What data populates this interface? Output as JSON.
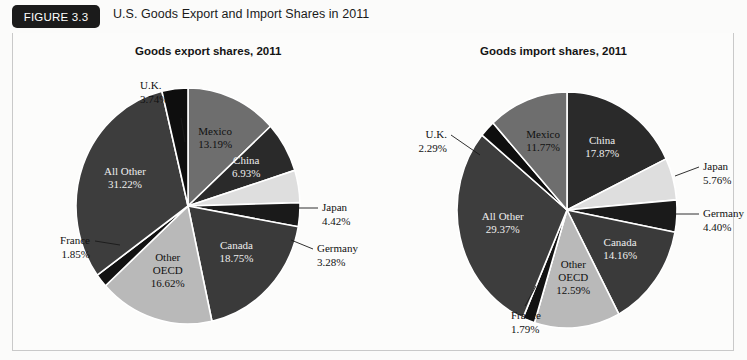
{
  "header": {
    "badge": "FIGURE 3.3",
    "title": "U.S. Goods Export and Import Shares in 2011"
  },
  "palette": {
    "black": "#111111",
    "dark_gray": "#3a3a3a",
    "mid_gray": "#6e6e6e",
    "light_gray": "#b9b9b9",
    "pale": "#dedede",
    "separator": "#ffffff",
    "text": "#111111",
    "text_on_dark": "#ededed",
    "badge_bg": "#1b1b1b",
    "frame_border": "#c9c9c9",
    "page_bg": "#fbfbfa"
  },
  "chart_data": [
    {
      "type": "pie",
      "id": "export",
      "title": "Goods export shares, 2011",
      "unit": "%",
      "start_angle": 0,
      "categories": [
        "Mexico",
        "China",
        "Japan",
        "Germany",
        "Canada",
        "Other OECD",
        "France",
        "All Other",
        "U.K."
      ],
      "values": [
        13.19,
        6.93,
        4.42,
        3.28,
        18.75,
        16.62,
        1.85,
        31.22,
        3.74
      ],
      "slices": [
        {
          "label": "Mexico",
          "value": 13.19,
          "text": "13.19%",
          "color": "#6e6e6e",
          "label_pos": "inside",
          "on_dark": false
        },
        {
          "label": "China",
          "value": 6.93,
          "text": "6.93%",
          "color": "#2a2a2a",
          "label_pos": "inside",
          "on_dark": true
        },
        {
          "label": "Japan",
          "value": 4.42,
          "text": "4.42%",
          "color": "#dedede",
          "label_pos": "outside",
          "on_dark": false
        },
        {
          "label": "Germany",
          "value": 3.28,
          "text": "3.28%",
          "color": "#1a1a1a",
          "label_pos": "outside",
          "on_dark": false
        },
        {
          "label": "Canada",
          "value": 18.75,
          "text": "18.75%",
          "color": "#3a3a3a",
          "label_pos": "inside",
          "on_dark": true
        },
        {
          "label": "Other OECD",
          "value": 16.62,
          "text": "16.62%",
          "color": "#b9b9b9",
          "label_pos": "inside",
          "on_dark": false
        },
        {
          "label": "France",
          "value": 1.85,
          "text": "1.85%",
          "color": "#121212",
          "label_pos": "outside",
          "on_dark": false
        },
        {
          "label": "All Other",
          "value": 31.22,
          "text": "31.22%",
          "color": "#3d3d3d",
          "label_pos": "inside",
          "on_dark": true
        },
        {
          "label": "U.K.",
          "value": 3.74,
          "text": "3.74%",
          "color": "#0e0e0e",
          "label_pos": "outside",
          "on_dark": false
        }
      ]
    },
    {
      "type": "pie",
      "id": "import",
      "title": "Goods import shares, 2011",
      "unit": "%",
      "start_angle": 0,
      "categories": [
        "China",
        "Japan",
        "Germany",
        "Canada",
        "Other OECD",
        "France",
        "All Other",
        "U.K.",
        "Mexico"
      ],
      "values": [
        17.87,
        5.76,
        4.4,
        14.16,
        12.59,
        1.79,
        29.37,
        2.29,
        11.77
      ],
      "slices": [
        {
          "label": "China",
          "value": 17.87,
          "text": "17.87%",
          "color": "#2a2a2a",
          "label_pos": "inside",
          "on_dark": true
        },
        {
          "label": "Japan",
          "value": 5.76,
          "text": "5.76%",
          "color": "#dedede",
          "label_pos": "outside",
          "on_dark": false
        },
        {
          "label": "Germany",
          "value": 4.4,
          "text": "4.40%",
          "color": "#1a1a1a",
          "label_pos": "outside",
          "on_dark": false
        },
        {
          "label": "Canada",
          "value": 14.16,
          "text": "14.16%",
          "color": "#3a3a3a",
          "label_pos": "inside",
          "on_dark": true
        },
        {
          "label": "Other OECD",
          "value": 12.59,
          "text": "12.59%",
          "color": "#b9b9b9",
          "label_pos": "inside",
          "on_dark": false
        },
        {
          "label": "France",
          "value": 1.79,
          "text": "1.79%",
          "color": "#121212",
          "label_pos": "outside",
          "on_dark": false
        },
        {
          "label": "All Other",
          "value": 29.37,
          "text": "29.37%",
          "color": "#3d3d3d",
          "label_pos": "inside",
          "on_dark": true
        },
        {
          "label": "U.K.",
          "value": 2.29,
          "text": "2.29%",
          "color": "#0e0e0e",
          "label_pos": "outside",
          "on_dark": false
        },
        {
          "label": "Mexico",
          "value": 11.77,
          "text": "11.77%",
          "color": "#6e6e6e",
          "label_pos": "inside",
          "on_dark": false
        }
      ]
    }
  ]
}
